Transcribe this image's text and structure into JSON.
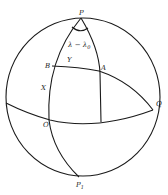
{
  "figure": {
    "type": "celestial-sphere-diagram",
    "colors": {
      "line": "#1a1a1a",
      "label": "#222222",
      "background": "#ffffff"
    },
    "labels": {
      "pole_north": "P",
      "pole_south": "P",
      "pole_south_sub": "1",
      "point_b": "B",
      "point_a": "A",
      "point_x": "X",
      "point_o": "O",
      "point_q": "Q",
      "arc_y": "Y",
      "angle": "λ − λ",
      "angle_sub": "0"
    }
  }
}
